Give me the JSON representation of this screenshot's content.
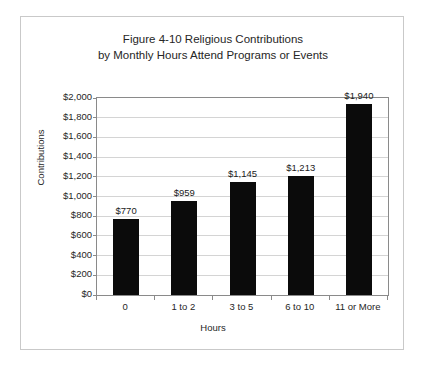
{
  "chart_data": {
    "type": "bar",
    "title": "Figure 4-10 Religious Contributions by Monthly Hours Attend Programs or Events",
    "title_lines": [
      "Figure 4-10 Religious Contributions",
      "by Monthly Hours Attend Programs or Events"
    ],
    "xlabel": "Hours",
    "ylabel": "Contributions",
    "categories": [
      "0",
      "1 to 2",
      "3 to 5",
      "6 to 10",
      "11 or More"
    ],
    "values": [
      770,
      959,
      1145,
      1213,
      1940
    ],
    "value_labels": [
      "$770",
      "$959",
      "$1,145",
      "$1,213",
      "$1,940"
    ],
    "ylim": [
      0,
      2000
    ],
    "ytick_step": 200,
    "ytick_labels": [
      "$2,000",
      "$1,800",
      "$1,600",
      "$1,400",
      "$1,200",
      "$1,000",
      "$800",
      "$600",
      "$400",
      "$200",
      "$0"
    ],
    "ytick_values": [
      2000,
      1800,
      1600,
      1400,
      1200,
      1000,
      800,
      600,
      400,
      200,
      0
    ],
    "grid": true,
    "legend": false,
    "bar_color": "#0b0b0b",
    "gridline_color": "#d4d4d4",
    "axis_color": "#8a8a8a",
    "frame_color": "#c9c9c9",
    "background": "#ffffff"
  }
}
